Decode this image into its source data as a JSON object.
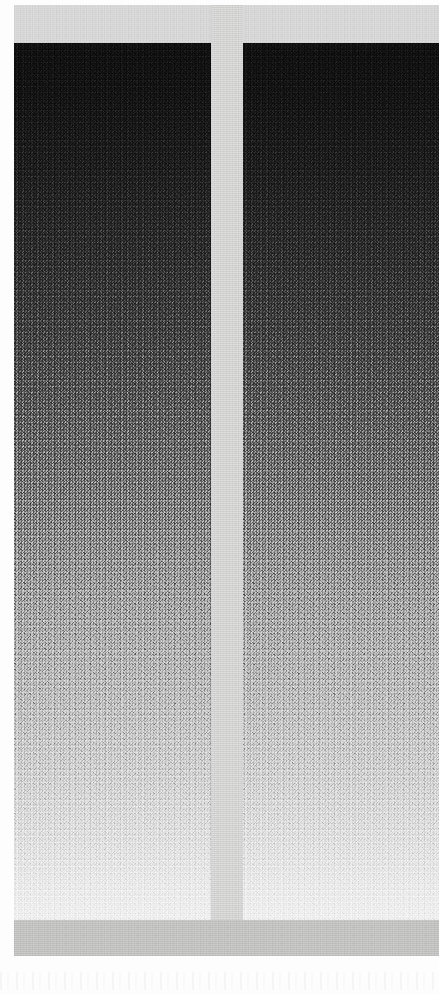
{
  "document": {
    "kind": "scanned-grayscale-gradient-plate",
    "title": "Grayscale Gradient Plate",
    "page_width": 439,
    "page_height": 995,
    "background_color": "#ffffff"
  },
  "plate": {
    "frame_color": "#d9d9d6",
    "x": 14,
    "y": 5,
    "width": 425,
    "height": 951,
    "top_band": {
      "name": "top-margin-band",
      "color": "#dedede",
      "height": 38
    },
    "divider": {
      "name": "center-divider",
      "color": "#dcdcda",
      "width": 32
    },
    "bottom_band": {
      "name": "bottom-margin-band",
      "color": "#c9c9c7",
      "height": 36
    }
  },
  "panels": [
    {
      "id": "panel-left",
      "label": "Left gradient panel",
      "x": 14,
      "y": 43,
      "width": 197,
      "height": 877,
      "orientation": "vertical",
      "direction": "dark-to-light",
      "top_color": "#0d0d0d",
      "mid_color": "#858585",
      "bottom_color": "#f3f3f3",
      "texture": "dithered-halftone-noise"
    },
    {
      "id": "panel-right",
      "label": "Right gradient panel",
      "x": 243,
      "y": 43,
      "width": 196,
      "height": 877,
      "orientation": "vertical",
      "direction": "dark-to-light",
      "top_color": "#0d0d0d",
      "mid_color": "#858585",
      "bottom_color": "#f3f3f3",
      "texture": "dithered-halftone-noise"
    }
  ],
  "artifacts": {
    "bottom_scan_noise": true,
    "noise_opacity": "0.035"
  }
}
